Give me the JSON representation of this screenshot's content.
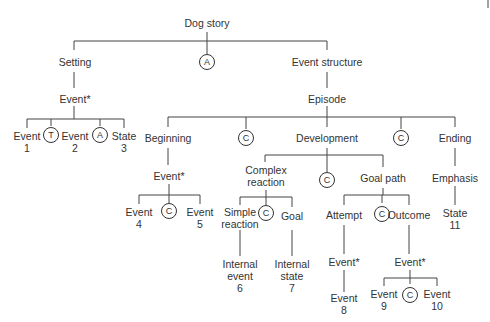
{
  "diagram": {
    "root": "Dog story",
    "nodes": {
      "setting": "Setting",
      "root_connector": "A",
      "event_structure": "Event structure",
      "setting_event": "Event*",
      "event1": [
        "Event",
        "1"
      ],
      "t_connector": "T",
      "event2": [
        "Event",
        "2"
      ],
      "a_connector2": "A",
      "state3": [
        "State",
        "3"
      ],
      "episode": "Episode",
      "beginning": "Beginning",
      "c1": "C",
      "development": "Development",
      "c2": "C",
      "ending": "Ending",
      "beginning_event": "Event*",
      "event4": [
        "Event",
        "4"
      ],
      "c3": "C",
      "event5": [
        "Event",
        "5"
      ],
      "complex_reaction": [
        "Complex",
        "reaction"
      ],
      "c4": "C",
      "goal_path": "Goal path",
      "emphasis": "Emphasis",
      "state11": [
        "State",
        "11"
      ],
      "simple_reaction": [
        "Simple",
        "reaction"
      ],
      "c5": "C",
      "goal": "Goal",
      "internal_event6": [
        "Internal",
        "event",
        "6"
      ],
      "internal_state7": [
        "Internal",
        "state",
        "7"
      ],
      "attempt": "Attempt",
      "c6": "C",
      "outcome": "Outcome",
      "attempt_event": "Event*",
      "outcome_event": "Event*",
      "event8": [
        "Event",
        "8"
      ],
      "event9": [
        "Event",
        "9"
      ],
      "c7": "C",
      "event10": [
        "Event",
        "10"
      ]
    }
  }
}
